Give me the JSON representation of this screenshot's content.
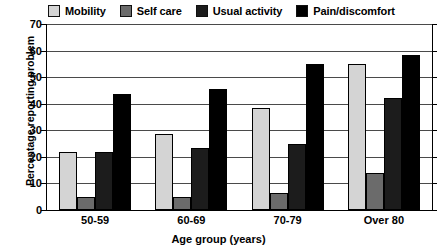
{
  "chart_data": {
    "type": "bar",
    "title": "",
    "xlabel": "Age group (years)",
    "ylabel": "Percentage reporting problem",
    "categories": [
      "50-59",
      "60-69",
      "70-79",
      "Over 80"
    ],
    "series": [
      {
        "name": "Mobility",
        "color": "#d4d4d4",
        "values": [
          22,
          28.5,
          38.5,
          55
        ]
      },
      {
        "name": "Self care",
        "color": "#6b6b6b",
        "values": [
          5,
          5,
          6.5,
          14
        ]
      },
      {
        "name": "Usual activity",
        "color": "#1c1c1c",
        "values": [
          22,
          23.5,
          25,
          42
        ]
      },
      {
        "name": "Pain/discomfort",
        "color": "#000000",
        "values": [
          43.5,
          45.5,
          55,
          58.5
        ]
      }
    ],
    "ylim": [
      0,
      70
    ],
    "yticks": [
      0,
      10,
      20,
      30,
      40,
      50,
      60,
      70
    ],
    "ytick_labels": [
      "0",
      "10",
      "20",
      "30",
      "40",
      "50",
      "60",
      "70"
    ],
    "grid": true,
    "legend_position": "top"
  }
}
